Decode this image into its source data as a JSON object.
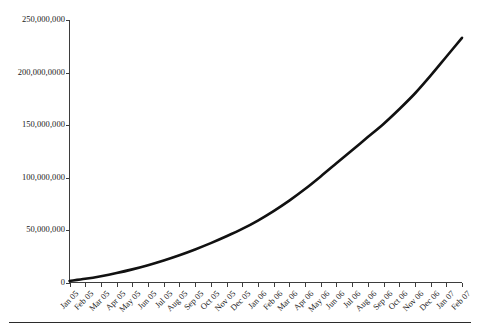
{
  "chart_data": {
    "type": "line",
    "title": "",
    "subtitle": "",
    "xlabel": "",
    "ylabel": "",
    "grid": false,
    "legend": "none",
    "xlim": [
      "Jan 05",
      "Feb 07"
    ],
    "ylim": [
      0,
      250000000
    ],
    "ytick_labels": [
      "250,000,000",
      "200,000,0000",
      "150,000,000",
      "100,000,000",
      "50,000,000",
      "0"
    ],
    "ytick_values": [
      250000000,
      200000000,
      150000000,
      100000000,
      50000000,
      0
    ],
    "categories": [
      "Jan 05",
      "Feb 05",
      "Mar 05",
      "Apr 05",
      "May 05",
      "Jun 05",
      "Jul 05",
      "Aug 05",
      "Sep 05",
      "Oct 05",
      "Nov 05",
      "Dec 05",
      "Jan 06",
      "Feb 06",
      "Mar 06",
      "Apr 06",
      "May 06",
      "Jun 06",
      "Jul 06",
      "Aug 06",
      "Sep 06",
      "Oct 06",
      "Nov 06",
      "Dec 06",
      "Jan 07",
      "Feb 07"
    ],
    "series": [
      {
        "name": "Cumulative total",
        "color": "#111111",
        "values": [
          1500000,
          3500000,
          6000000,
          9000000,
          12500000,
          16500000,
          21000000,
          26000000,
          31500000,
          37500000,
          44000000,
          51000000,
          59000000,
          68000000,
          78000000,
          89000000,
          101000000,
          113500000,
          126000000,
          138500000,
          151000000,
          165000000,
          180000000,
          197000000,
          215000000,
          233000000
        ]
      }
    ]
  },
  "axes": {
    "y_axis_name": "y-axis",
    "x_axis_name": "x-axis"
  }
}
